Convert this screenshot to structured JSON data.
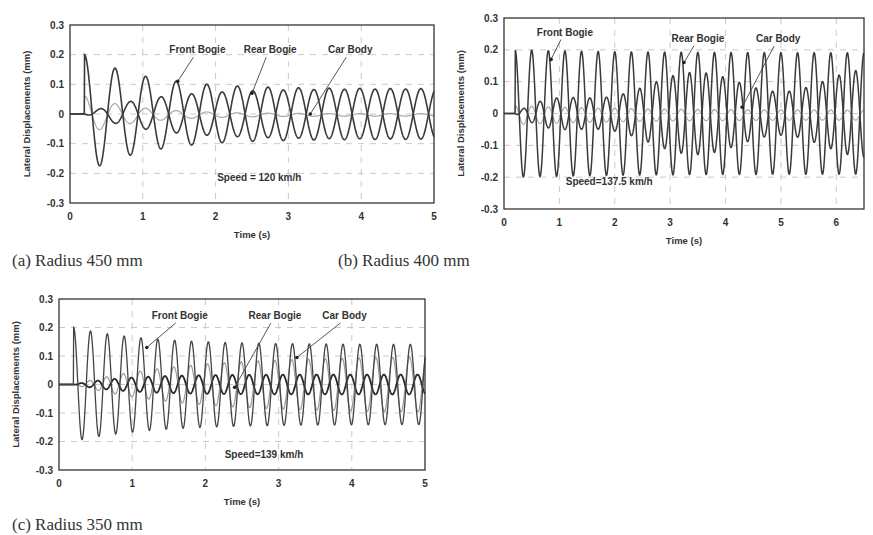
{
  "figure": {
    "captions": [
      "(a) Radius 450 mm",
      "(b) Radius 400 mm",
      "(c) Radius 350 mm"
    ]
  },
  "chart_data": [
    {
      "id": "a",
      "type": "line",
      "title": "",
      "caption": "(a) Radius 450 mm",
      "xlabel": "Time (s)",
      "ylabel": "Lateral Displacements (mm)",
      "xlim": [
        0,
        5
      ],
      "ylim": [
        -0.3,
        0.3
      ],
      "xticks": [
        0,
        1,
        2,
        3,
        4,
        5
      ],
      "yticks": [
        0.3,
        0.2,
        0.1,
        0,
        -0.1,
        -0.2,
        -0.3
      ],
      "ytick_labels": [
        "0.3",
        "0.2",
        "0.1",
        "0",
        "-0.1",
        "-0.2",
        "-0.3"
      ],
      "grid": "dashed",
      "annotation": "Speed = 120 km/h",
      "series": [
        {
          "name": "Front Bogie",
          "start": 0.2,
          "initial_peak": 0.2,
          "period": 0.42,
          "steady_amplitude": 0.085,
          "decay": 1.2,
          "color": "#3a3a3a",
          "width": 1.6
        },
        {
          "name": "Rear Bogie",
          "start": 0.2,
          "initial_peak": 0.0,
          "period": 0.42,
          "steady_amplitude": 0.085,
          "growth": 1.1,
          "phase": 3.14,
          "color": "#3a3a3a",
          "width": 1.6
        },
        {
          "name": "Car Body",
          "start": 0.2,
          "initial_peak": 0.065,
          "period": 0.42,
          "steady_amplitude": 0.004,
          "decay": 1.4,
          "offset": -0.003,
          "color": "#a8a8a8",
          "width": 1.2
        }
      ],
      "labels": [
        {
          "text": "Front Bogie",
          "x": 1.75,
          "y": 0.205,
          "arrow_to": [
            1.48,
            0.11
          ]
        },
        {
          "text": "Rear Bogie",
          "x": 2.75,
          "y": 0.205,
          "arrow_to": [
            2.5,
            0.07
          ]
        },
        {
          "text": "Car Body",
          "x": 3.85,
          "y": 0.205,
          "arrow_to": [
            3.3,
            0.0
          ]
        }
      ]
    },
    {
      "id": "b",
      "type": "line",
      "title": "",
      "caption": "(b) Radius 400 mm",
      "xlabel": "Time (s)",
      "ylabel": "Lateral Displacements (mm)",
      "xlim": [
        0,
        6.5
      ],
      "ylim": [
        -0.3,
        0.3
      ],
      "xticks": [
        0,
        1,
        2,
        3,
        4,
        5,
        6
      ],
      "yticks": [
        0.3,
        0.2,
        0.1,
        0,
        -0.1,
        -0.2,
        -0.3
      ],
      "ytick_labels": [
        "0.3",
        "0.2",
        "0.1",
        "0",
        "-0.1",
        "-0.2",
        "-0.3"
      ],
      "grid": "dashed",
      "annotation": "Speed=137.5 km/h",
      "series": [
        {
          "name": "Front Bogie",
          "start": 0.2,
          "initial_peak": 0.2,
          "period": 0.3,
          "steady_amplitude": 0.19,
          "color": "#3a3a3a",
          "width": 1.5
        },
        {
          "name": "Rear Bogie",
          "start": 0.2,
          "initial_peak": 0.0,
          "period": 0.3,
          "steady_amplitude": 0.14,
          "growth": 0.8,
          "phase": 3.14,
          "beat_period": 3.2,
          "color": "#3a3a3a",
          "width": 1.5
        },
        {
          "name": "Car Body",
          "start": 0.2,
          "initial_peak": 0.03,
          "period": 0.3,
          "steady_amplitude": 0.015,
          "offset": -0.005,
          "color": "#a8a8a8",
          "width": 1.2
        }
      ],
      "labels": [
        {
          "text": "Front Bogie",
          "x": 1.1,
          "y": 0.245,
          "arrow_to": [
            0.85,
            0.17
          ]
        },
        {
          "text": "Rear Bogie",
          "x": 3.5,
          "y": 0.225,
          "arrow_to": [
            3.25,
            0.16
          ]
        },
        {
          "text": "Car Body",
          "x": 4.95,
          "y": 0.225,
          "arrow_to": [
            4.3,
            0.02
          ]
        }
      ]
    },
    {
      "id": "c",
      "type": "line",
      "title": "",
      "caption": "(c) Radius 350 mm",
      "xlabel": "Time (s)",
      "ylabel": "Lateral Displacements (mm)",
      "xlim": [
        0,
        5
      ],
      "ylim": [
        -0.3,
        0.3
      ],
      "xticks": [
        0,
        1,
        2,
        3,
        4,
        5
      ],
      "yticks": [
        0.3,
        0.2,
        0.1,
        0,
        -0.1,
        -0.2,
        -0.3
      ],
      "ytick_labels": [
        "0.3",
        "0.2",
        "0.1",
        "0",
        "-0.1",
        "-0.2",
        "-0.3"
      ],
      "grid": "dashed",
      "annotation": "Speed=139 km/h",
      "series": [
        {
          "name": "Front Bogie",
          "start": 0.2,
          "initial_peak": 0.2,
          "period": 0.23,
          "steady_amplitude": 0.14,
          "decay": 1.0,
          "color": "#444444",
          "width": 1.3
        },
        {
          "name": "Rear Bogie",
          "start": 0.2,
          "initial_peak": 0.0,
          "period": 0.23,
          "steady_amplitude": 0.035,
          "growth": 1.5,
          "phase": 3.6,
          "color": "#2a2a2a",
          "width": 1.8
        },
        {
          "name": "Car Body",
          "start": 0.2,
          "initial_peak": 0.0,
          "period": 0.23,
          "steady_amplitude": 0.1,
          "growth": 0.7,
          "phase": 0.3,
          "color": "#9a9a9a",
          "width": 1.2
        }
      ],
      "labels": [
        {
          "text": "Front Bogie",
          "x": 1.65,
          "y": 0.23,
          "arrow_to": [
            1.2,
            0.13
          ]
        },
        {
          "text": "Rear Bogie",
          "x": 2.95,
          "y": 0.23,
          "arrow_to": [
            2.4,
            -0.01
          ]
        },
        {
          "text": "Car Body",
          "x": 3.9,
          "y": 0.23,
          "arrow_to": [
            3.25,
            0.095
          ]
        }
      ]
    }
  ]
}
